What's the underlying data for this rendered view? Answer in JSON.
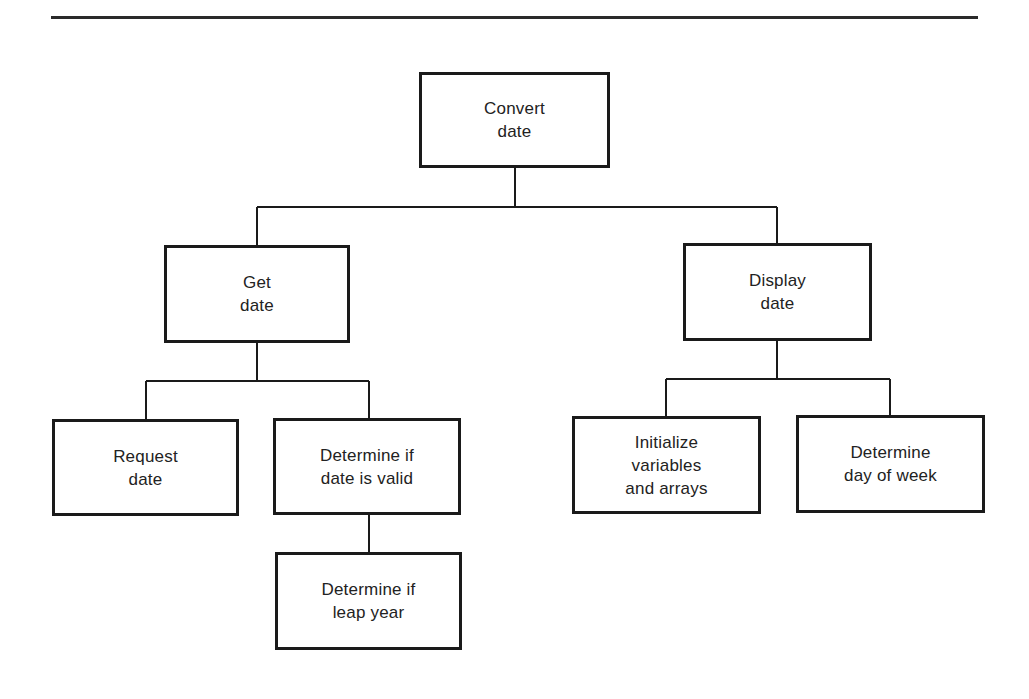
{
  "diagram": {
    "type": "hierarchy-chart",
    "colors": {
      "line": "#1a1a1a",
      "background": "#ffffff",
      "text": "#222222"
    },
    "nodes": {
      "convert_date": {
        "label": "Convert\ndate"
      },
      "get_date": {
        "label": "Get\ndate"
      },
      "display_date": {
        "label": "Display\ndate"
      },
      "request_date": {
        "label": "Request\ndate"
      },
      "validate_date": {
        "label": "Determine if\ndate is valid"
      },
      "leap_year": {
        "label": "Determine if\nleap year"
      },
      "init_vars": {
        "label": "Initialize\nvariables\nand arrays"
      },
      "day_of_week": {
        "label": "Determine\nday of week"
      }
    },
    "edges": [
      {
        "from": "convert_date",
        "to": "get_date"
      },
      {
        "from": "convert_date",
        "to": "display_date"
      },
      {
        "from": "get_date",
        "to": "request_date"
      },
      {
        "from": "get_date",
        "to": "validate_date"
      },
      {
        "from": "validate_date",
        "to": "leap_year"
      },
      {
        "from": "display_date",
        "to": "init_vars"
      },
      {
        "from": "display_date",
        "to": "day_of_week"
      }
    ]
  }
}
